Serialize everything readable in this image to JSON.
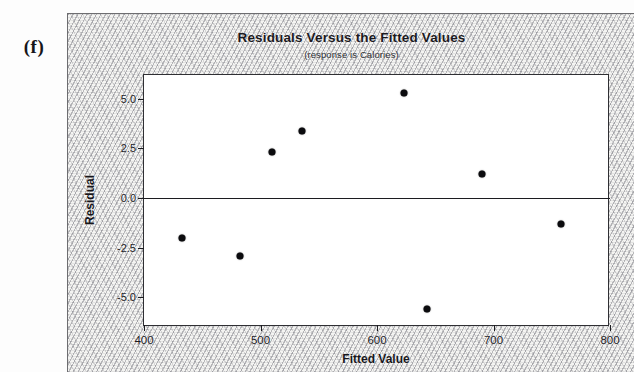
{
  "figure": {
    "label": "(f)"
  },
  "chart_data": {
    "type": "scatter",
    "title": "Residuals Versus the Fitted Values",
    "subtitle": "(response is Calories)",
    "xlabel": "Fitted Value",
    "ylabel": "Residual",
    "xlim": [
      400,
      800
    ],
    "ylim": [
      -6.5,
      6.2
    ],
    "xticks": [
      400,
      500,
      600,
      700,
      800
    ],
    "xtick_labels": [
      "400",
      "500",
      "600",
      "700",
      "800"
    ],
    "yticks": [
      5.0,
      2.5,
      0.0,
      -2.5,
      -5.0
    ],
    "ytick_labels": [
      "5.0",
      "2.5",
      "0.0",
      "-2.5",
      "-5.0"
    ],
    "grid": false,
    "legend": null,
    "reference_line": {
      "axis": "y",
      "value": 0.0
    },
    "x": [
      433,
      482,
      510,
      536,
      623,
      643,
      690,
      758
    ],
    "y": [
      -2.0,
      -2.9,
      2.3,
      3.4,
      5.3,
      -5.6,
      1.2,
      -1.3
    ],
    "points": [
      {
        "x": 433,
        "y": -2.0
      },
      {
        "x": 482,
        "y": -2.9
      },
      {
        "x": 510,
        "y": 2.3
      },
      {
        "x": 536,
        "y": 3.4
      },
      {
        "x": 623,
        "y": 5.3
      },
      {
        "x": 643,
        "y": -5.6
      },
      {
        "x": 690,
        "y": 1.2
      },
      {
        "x": 758,
        "y": -1.3
      }
    ],
    "marker": {
      "shape": "circle",
      "color": "#0b0b0e",
      "size": 7
    }
  }
}
